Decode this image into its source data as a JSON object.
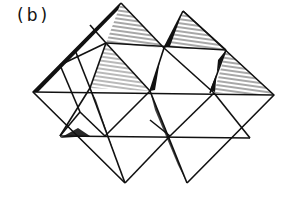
{
  "figure": {
    "label": "(b)",
    "colors": {
      "ink": "#111111",
      "background": "#ffffff"
    }
  }
}
